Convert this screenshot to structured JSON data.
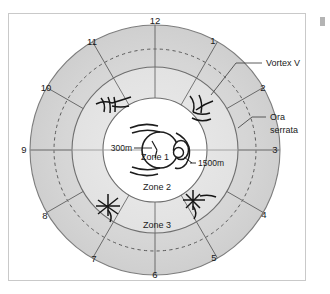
{
  "figure": {
    "background_color": "#ffffff",
    "frame_color": "#c9c9c9",
    "ring_fill_outer": "#d5d5d5",
    "ring_fill_middle": "#e8e8e8",
    "ring_fill_inner": "#ffffff",
    "line_color": "#4a4a4a",
    "text_color": "#1a1a1a"
  },
  "clock_hours": [
    {
      "id": "1",
      "label": "1"
    },
    {
      "id": "2",
      "label": "2"
    },
    {
      "id": "3",
      "label": "3"
    },
    {
      "id": "4",
      "label": "4"
    },
    {
      "id": "5",
      "label": "5"
    },
    {
      "id": "6",
      "label": "6"
    },
    {
      "id": "7",
      "label": "7"
    },
    {
      "id": "8",
      "label": "8"
    },
    {
      "id": "9",
      "label": "9"
    },
    {
      "id": "10",
      "label": "10"
    },
    {
      "id": "11",
      "label": "11"
    },
    {
      "id": "12",
      "label": "12"
    }
  ],
  "zones": [
    {
      "id": "zone1",
      "label": "Zone 1"
    },
    {
      "id": "zone2",
      "label": "Zone 2"
    },
    {
      "id": "zone3",
      "label": "Zone 3"
    }
  ],
  "dimensions": [
    {
      "id": "disc-300",
      "label": "300m"
    },
    {
      "id": "macula-1500",
      "label": "1500m"
    }
  ],
  "annotations": [
    {
      "id": "vortex-vein",
      "label": "Vortex V"
    },
    {
      "id": "ora-serrata",
      "line1": "Ora",
      "line2": "serrata"
    }
  ],
  "structures": {
    "optic_disc": "optic-disc",
    "macula": "macula",
    "vortex_veins_count": 4,
    "ora_serrata_style": "dashed"
  }
}
